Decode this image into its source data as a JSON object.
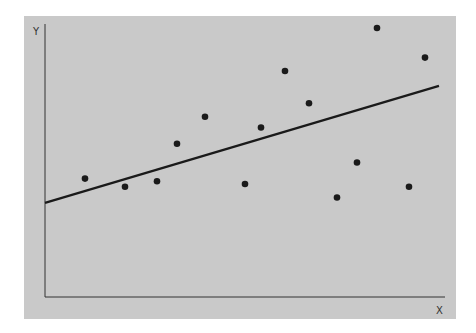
{
  "chart_data": {
    "type": "scatter",
    "title": "",
    "xlabel": "X",
    "ylabel": "Y",
    "xlim": [
      0,
      10
    ],
    "ylim": [
      0,
      10
    ],
    "grid": false,
    "legend": null,
    "tick_labels": false,
    "points": [
      {
        "x": 1.0,
        "y": 4.4
      },
      {
        "x": 2.0,
        "y": 4.1
      },
      {
        "x": 2.8,
        "y": 4.3
      },
      {
        "x": 3.3,
        "y": 5.7
      },
      {
        "x": 4.0,
        "y": 6.7
      },
      {
        "x": 5.0,
        "y": 4.2
      },
      {
        "x": 5.4,
        "y": 6.3
      },
      {
        "x": 6.0,
        "y": 8.4
      },
      {
        "x": 6.6,
        "y": 7.2
      },
      {
        "x": 7.3,
        "y": 3.7
      },
      {
        "x": 7.8,
        "y": 5.0
      },
      {
        "x": 8.3,
        "y": 10.0
      },
      {
        "x": 9.1,
        "y": 4.1
      },
      {
        "x": 9.5,
        "y": 8.9
      }
    ],
    "trend_line": {
      "x0": 0.0,
      "y0": 3.5,
      "x1": 9.85,
      "y1": 7.85
    },
    "colors": {
      "background": "#c9c9c9",
      "points": "#1a1a1a",
      "line": "#1a1a1a",
      "axes": "#333333"
    }
  },
  "labels": {
    "x": "X",
    "y": "Y"
  }
}
